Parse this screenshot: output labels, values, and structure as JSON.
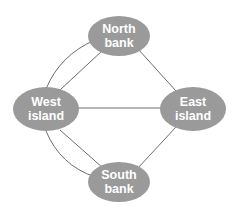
{
  "diagram": {
    "colors": {
      "node_fill": "#9a9a9a",
      "node_text": "#ffffff",
      "edge": "#6e6e6e",
      "background": "#ffffff"
    },
    "nodes": [
      {
        "id": "north",
        "line1": "North",
        "line2": "bank"
      },
      {
        "id": "west",
        "line1": "West",
        "line2": "island"
      },
      {
        "id": "east",
        "line1": "East",
        "line2": "island"
      },
      {
        "id": "south",
        "line1": "South",
        "line2": "bank"
      }
    ],
    "edges": [
      {
        "from": "west",
        "to": "north",
        "style": "curved"
      },
      {
        "from": "west",
        "to": "north",
        "style": "straight"
      },
      {
        "from": "west",
        "to": "south",
        "style": "curved"
      },
      {
        "from": "west",
        "to": "south",
        "style": "straight"
      },
      {
        "from": "west",
        "to": "east",
        "style": "straight"
      },
      {
        "from": "north",
        "to": "east",
        "style": "straight"
      },
      {
        "from": "south",
        "to": "east",
        "style": "straight"
      }
    ]
  }
}
